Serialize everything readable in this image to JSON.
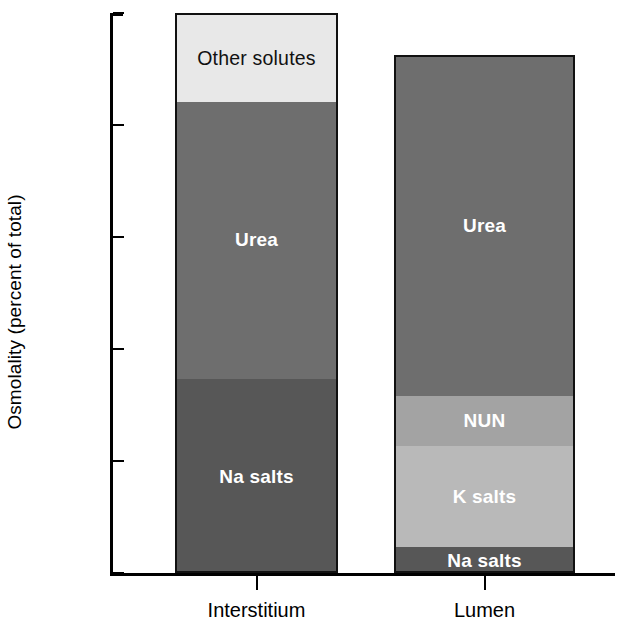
{
  "chart_data": {
    "type": "bar",
    "subtype": "stacked-bar",
    "title": "",
    "xlabel": "",
    "ylabel": "Osmolality (percent of total)",
    "ylim": [
      0,
      100
    ],
    "yticks": [
      0,
      20,
      40,
      60,
      80,
      100
    ],
    "ytick_labels": [
      "0",
      "20",
      "40",
      "60",
      "80",
      "100"
    ],
    "grid": false,
    "legend": "none (in-segment labels)",
    "categories": [
      "Interstitium",
      "Lumen"
    ],
    "stack_order_bottom_to_top": [
      "Na salts",
      "K salts",
      "NUN",
      "Urea",
      "Other solutes"
    ],
    "series": [
      {
        "name": "Na salts",
        "values": [
          35.0,
          5.0
        ],
        "color": "#575757"
      },
      {
        "name": "K salts",
        "values": [
          0.0,
          18.0
        ],
        "color": "#b9b9b9"
      },
      {
        "name": "NUN",
        "values": [
          0.0,
          9.0
        ],
        "color": "#a3a3a3"
      },
      {
        "name": "Urea",
        "values": [
          49.5,
          60.5
        ],
        "color": "#6e6e6e"
      },
      {
        "name": "Other solutes",
        "values": [
          15.5,
          0.0
        ],
        "color": "#e8e8e8"
      }
    ],
    "column_totals": [
      100.0,
      92.5
    ],
    "bars": [
      {
        "category": "Interstitium",
        "total": 100.0,
        "segments": [
          {
            "label": "Na salts",
            "from": 0.0,
            "to": 35.0,
            "value": 35.0,
            "color": "#575757",
            "text_color": "#ffffff"
          },
          {
            "label": "Urea",
            "from": 35.0,
            "to": 84.5,
            "value": 49.5,
            "color": "#6e6e6e",
            "text_color": "#ffffff"
          },
          {
            "label": "Other solutes",
            "from": 84.5,
            "to": 100.0,
            "value": 15.5,
            "color": "#e8e8e8",
            "text_color": "#111111"
          }
        ]
      },
      {
        "category": "Lumen",
        "total": 92.5,
        "segments": [
          {
            "label": "Na salts",
            "from": 0.0,
            "to": 5.0,
            "value": 5.0,
            "color": "#575757",
            "text_color": "#ffffff"
          },
          {
            "label": "K salts",
            "from": 5.0,
            "to": 23.0,
            "value": 18.0,
            "color": "#b9b9b9",
            "text_color": "#ffffff"
          },
          {
            "label": "NUN",
            "from": 23.0,
            "to": 32.0,
            "value": 9.0,
            "color": "#a3a3a3",
            "text_color": "#ffffff"
          },
          {
            "label": "Urea",
            "from": 32.0,
            "to": 92.5,
            "value": 60.5,
            "color": "#6e6e6e",
            "text_color": "#ffffff"
          }
        ]
      }
    ]
  },
  "axis": {
    "y_title": "Osmolality (percent of total)",
    "tick_labels": [
      "100",
      "80",
      "60",
      "40",
      "20",
      "0"
    ],
    "category_labels": [
      "Interstitium",
      "Lumen"
    ]
  },
  "colors": {
    "axis": "#000000",
    "background": "#ffffff",
    "other_solutes": "#e8e8e8",
    "urea": "#6e6e6e",
    "na_salts": "#575757",
    "k_salts": "#b9b9b9",
    "nun": "#a3a3a3"
  }
}
